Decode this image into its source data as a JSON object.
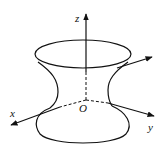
{
  "diagram": {
    "type": "hyperboloid-of-one-sheet",
    "stroke_color": "#111111",
    "background": "#ffffff",
    "labels": {
      "z_axis": "z",
      "x_axis": "x",
      "y_axis": "y",
      "origin": "O"
    },
    "axes": [
      {
        "name": "z",
        "direction": "up"
      },
      {
        "name": "x",
        "direction": "lower-left"
      },
      {
        "name": "y",
        "direction": "lower-right"
      },
      {
        "name": "unlabeled",
        "direction": "upper-right"
      }
    ]
  }
}
